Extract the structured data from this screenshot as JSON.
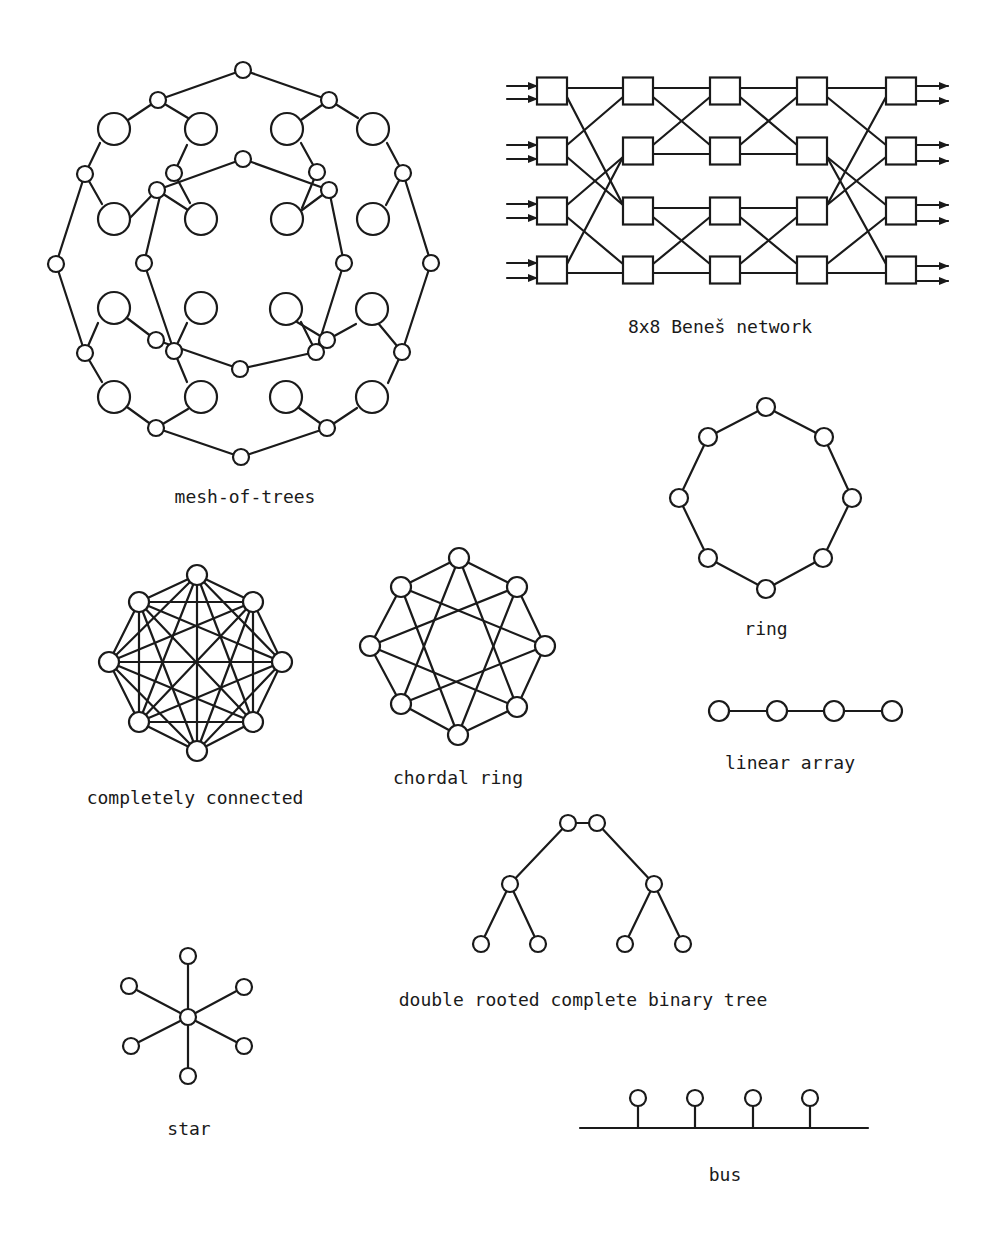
{
  "figure": {
    "stroke_color": "#1a1a1a",
    "background": "#ffffff"
  },
  "diagrams": {
    "mesh_of_trees": {
      "label": "mesh-of-trees",
      "label_pos": [
        245,
        503
      ],
      "large_radius": 16,
      "small_radius": 8,
      "large_nodes": [
        [
          114,
          129
        ],
        [
          201,
          129
        ],
        [
          287,
          129
        ],
        [
          373,
          129
        ],
        [
          114,
          219
        ],
        [
          201,
          219
        ],
        [
          287,
          219
        ],
        [
          373,
          219
        ],
        [
          114,
          308
        ],
        [
          201,
          308
        ],
        [
          286,
          309
        ],
        [
          372,
          309
        ],
        [
          114,
          397
        ],
        [
          201,
          397
        ],
        [
          286,
          397
        ],
        [
          372,
          397
        ]
      ],
      "small_nodes": [
        [
          243,
          70
        ],
        [
          158,
          100
        ],
        [
          329,
          100
        ],
        [
          85,
          174
        ],
        [
          174,
          173
        ],
        [
          157,
          190
        ],
        [
          243,
          159
        ],
        [
          317,
          172
        ],
        [
          329,
          190
        ],
        [
          403,
          173
        ],
        [
          56,
          264
        ],
        [
          144,
          263
        ],
        [
          344,
          263
        ],
        [
          431,
          263
        ],
        [
          85,
          353
        ],
        [
          156,
          340
        ],
        [
          174,
          351
        ],
        [
          240,
          369
        ],
        [
          327,
          340
        ],
        [
          316,
          352
        ],
        [
          402,
          352
        ],
        [
          156,
          428
        ],
        [
          327,
          428
        ],
        [
          241,
          457
        ]
      ],
      "edges": [
        [
          [
            243,
            70
          ],
          [
            158,
            100
          ]
        ],
        [
          [
            243,
            70
          ],
          [
            329,
            100
          ]
        ],
        [
          [
            158,
            100
          ],
          [
            128,
            120
          ]
        ],
        [
          [
            158,
            100
          ],
          [
            188,
            118
          ]
        ],
        [
          [
            329,
            100
          ],
          [
            301,
            120
          ]
        ],
        [
          [
            329,
            100
          ],
          [
            358,
            118
          ]
        ],
        [
          [
            56,
            264
          ],
          [
            85,
            174
          ]
        ],
        [
          [
            85,
            174
          ],
          [
            100,
            143
          ]
        ],
        [
          [
            85,
            174
          ],
          [
            102,
            204
          ]
        ],
        [
          [
            174,
            173
          ],
          [
            187,
            145
          ]
        ],
        [
          [
            157,
            190
          ],
          [
            188,
            210
          ]
        ],
        [
          [
            174,
            173
          ],
          [
            190,
            203
          ]
        ],
        [
          [
            243,
            159
          ],
          [
            157,
            190
          ]
        ],
        [
          [
            243,
            159
          ],
          [
            329,
            190
          ]
        ],
        [
          [
            144,
            263
          ],
          [
            160,
            196
          ]
        ],
        [
          [
            329,
            190
          ],
          [
            344,
            263
          ]
        ],
        [
          [
            317,
            172
          ],
          [
            301,
            143
          ]
        ],
        [
          [
            317,
            172
          ],
          [
            302,
            208
          ]
        ],
        [
          [
            329,
            190
          ],
          [
            298,
            213
          ]
        ],
        [
          [
            128,
            220
          ],
          [
            157,
            190
          ]
        ],
        [
          [
            403,
            173
          ],
          [
            387,
            143
          ]
        ],
        [
          [
            403,
            173
          ],
          [
            386,
            205
          ]
        ],
        [
          [
            431,
            263
          ],
          [
            403,
            173
          ]
        ],
        [
          [
            56,
            264
          ],
          [
            85,
            353
          ]
        ],
        [
          [
            85,
            353
          ],
          [
            98,
            323
          ]
        ],
        [
          [
            85,
            353
          ],
          [
            102,
            382
          ]
        ],
        [
          [
            144,
            263
          ],
          [
            174,
            351
          ]
        ],
        [
          [
            156,
            340
          ],
          [
            127,
            318
          ]
        ],
        [
          [
            156,
            340
          ],
          [
            240,
            369
          ]
        ],
        [
          [
            174,
            351
          ],
          [
            187,
            323
          ]
        ],
        [
          [
            174,
            351
          ],
          [
            187,
            382
          ]
        ],
        [
          [
            240,
            369
          ],
          [
            316,
            352
          ]
        ],
        [
          [
            344,
            263
          ],
          [
            316,
            352
          ]
        ],
        [
          [
            327,
            340
          ],
          [
            356,
            324
          ]
        ],
        [
          [
            316,
            352
          ],
          [
            301,
            322
          ]
        ],
        [
          [
            327,
            340
          ],
          [
            297,
            322
          ]
        ],
        [
          [
            402,
            352
          ],
          [
            378,
            323
          ]
        ],
        [
          [
            402,
            352
          ],
          [
            431,
            263
          ]
        ],
        [
          [
            402,
            352
          ],
          [
            388,
            383
          ]
        ],
        [
          [
            156,
            428
          ],
          [
            127,
            407
          ]
        ],
        [
          [
            156,
            428
          ],
          [
            188,
            409
          ]
        ],
        [
          [
            156,
            428
          ],
          [
            241,
            457
          ]
        ],
        [
          [
            327,
            428
          ],
          [
            299,
            408
          ]
        ],
        [
          [
            327,
            428
          ],
          [
            357,
            408
          ]
        ],
        [
          [
            327,
            428
          ],
          [
            241,
            457
          ]
        ],
        [
          [
            56,
            264
          ],
          [
            56,
            264
          ]
        ]
      ]
    },
    "benes": {
      "label": "8x8 Beneš network",
      "label_pos": [
        720,
        333
      ],
      "box_size": [
        30,
        27
      ],
      "columns_x": [
        552,
        638,
        725,
        812,
        901
      ],
      "rows_y": [
        91,
        151,
        211,
        270
      ],
      "input_arrows_y": [
        [
          86,
          99
        ],
        [
          145,
          159
        ],
        [
          204,
          218
        ],
        [
          263,
          278
        ]
      ],
      "output_arrows_y": [
        [
          86,
          101
        ],
        [
          145,
          161
        ],
        [
          205,
          221
        ],
        [
          266,
          281
        ]
      ],
      "stage_links": [
        [
          [
            0,
            0,
            0
          ],
          [
            0,
            0,
            2
          ],
          [
            0,
            1,
            0
          ],
          [
            0,
            1,
            2
          ],
          [
            0,
            2,
            1
          ],
          [
            0,
            2,
            3
          ],
          [
            0,
            3,
            1
          ],
          [
            0,
            3,
            3
          ]
        ],
        [
          [
            1,
            0,
            0
          ],
          [
            1,
            0,
            1
          ],
          [
            1,
            1,
            0
          ],
          [
            1,
            1,
            1
          ],
          [
            1,
            2,
            2
          ],
          [
            1,
            2,
            3
          ],
          [
            1,
            3,
            2
          ],
          [
            1,
            3,
            3
          ]
        ],
        [
          [
            2,
            0,
            0
          ],
          [
            2,
            0,
            1
          ],
          [
            2,
            1,
            0
          ],
          [
            2,
            1,
            1
          ],
          [
            2,
            2,
            2
          ],
          [
            2,
            2,
            3
          ],
          [
            2,
            3,
            2
          ],
          [
            2,
            3,
            3
          ]
        ],
        [
          [
            3,
            0,
            0
          ],
          [
            3,
            0,
            1
          ],
          [
            3,
            1,
            2
          ],
          [
            3,
            1,
            3
          ],
          [
            3,
            2,
            0
          ],
          [
            3,
            2,
            1
          ],
          [
            3,
            3,
            2
          ],
          [
            3,
            3,
            3
          ]
        ]
      ]
    },
    "ring": {
      "label": "ring",
      "label_pos": [
        766,
        635
      ],
      "radius": 9,
      "nodes": [
        [
          766,
          407
        ],
        [
          824,
          437
        ],
        [
          852,
          498
        ],
        [
          823,
          558
        ],
        [
          766,
          589
        ],
        [
          708,
          558
        ],
        [
          679,
          498
        ],
        [
          708,
          437
        ]
      ]
    },
    "linear_array": {
      "label": "linear array",
      "label_pos": [
        790,
        769
      ],
      "radius": 10,
      "nodes": [
        [
          719,
          711
        ],
        [
          777,
          711
        ],
        [
          834,
          711
        ],
        [
          892,
          711
        ]
      ]
    },
    "completely_connected": {
      "label": "completely connected",
      "label_pos": [
        195,
        804
      ],
      "radius": 10,
      "nodes": [
        [
          197,
          575
        ],
        [
          253,
          602
        ],
        [
          282,
          662
        ],
        [
          253,
          722
        ],
        [
          197,
          751
        ],
        [
          139,
          722
        ],
        [
          109,
          662
        ],
        [
          139,
          602
        ]
      ]
    },
    "chordal_ring": {
      "label": "chordal ring",
      "label_pos": [
        458,
        784
      ],
      "radius": 10,
      "nodes": [
        [
          459,
          558
        ],
        [
          517,
          587
        ],
        [
          545,
          646
        ],
        [
          517,
          707
        ],
        [
          458,
          735
        ],
        [
          401,
          704
        ],
        [
          370,
          646
        ],
        [
          401,
          587
        ]
      ]
    },
    "double_rooted_tree": {
      "label": "double rooted complete binary tree",
      "label_pos": [
        583,
        1006
      ],
      "radius": 8,
      "roots": [
        [
          568,
          823
        ],
        [
          597,
          823
        ]
      ],
      "mid": [
        [
          510,
          884
        ],
        [
          654,
          884
        ]
      ],
      "leaves": [
        [
          481,
          944
        ],
        [
          538,
          944
        ],
        [
          625,
          944
        ],
        [
          683,
          944
        ]
      ]
    },
    "star": {
      "label": "star",
      "label_pos": [
        189,
        1135
      ],
      "radius": 8,
      "center": [
        188,
        1017
      ],
      "leaves": [
        [
          188,
          956
        ],
        [
          244,
          987
        ],
        [
          244,
          1046
        ],
        [
          188,
          1076
        ],
        [
          131,
          1046
        ],
        [
          129,
          986
        ]
      ]
    },
    "bus": {
      "label": "bus",
      "label_pos": [
        725,
        1181
      ],
      "line": [
        [
          580,
          1128
        ],
        [
          868,
          1128
        ]
      ],
      "radius": 8,
      "taps": [
        [
          638,
          1098
        ],
        [
          695,
          1098
        ],
        [
          753,
          1098
        ],
        [
          810,
          1098
        ]
      ]
    }
  }
}
